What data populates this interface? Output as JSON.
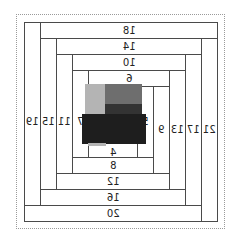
{
  "diagram": {
    "type": "log-cabin-quilt-block",
    "mirrored": true,
    "center_label_top": "6",
    "center_label_bottom": "4",
    "center_label_left": "7",
    "center_label_right": "5",
    "strips": {
      "top": [
        "18",
        "14",
        "10",
        "6"
      ],
      "bottom": [
        "20",
        "16",
        "12",
        "8",
        "4"
      ],
      "left": [
        "19",
        "15",
        "11",
        "7"
      ],
      "right": [
        "21",
        "17",
        "13",
        "9",
        "5"
      ]
    },
    "labels": {
      "s21": "21",
      "s20": "20",
      "s19": "19",
      "s18": "18",
      "s17": "17",
      "s16": "16",
      "s15": "15",
      "s14": "14",
      "s13": "13",
      "s12": "12",
      "s11": "11",
      "s10": "10",
      "s9": "9",
      "s8": "8",
      "s7": "7",
      "s6": "6",
      "s5": "5",
      "s4": "4"
    },
    "center_colors": {
      "light_gray": "#b4b4b4",
      "mid_gray": "#6e6e6e",
      "dark": "#2e2e2e",
      "darkest": "#1e1e1e"
    }
  }
}
